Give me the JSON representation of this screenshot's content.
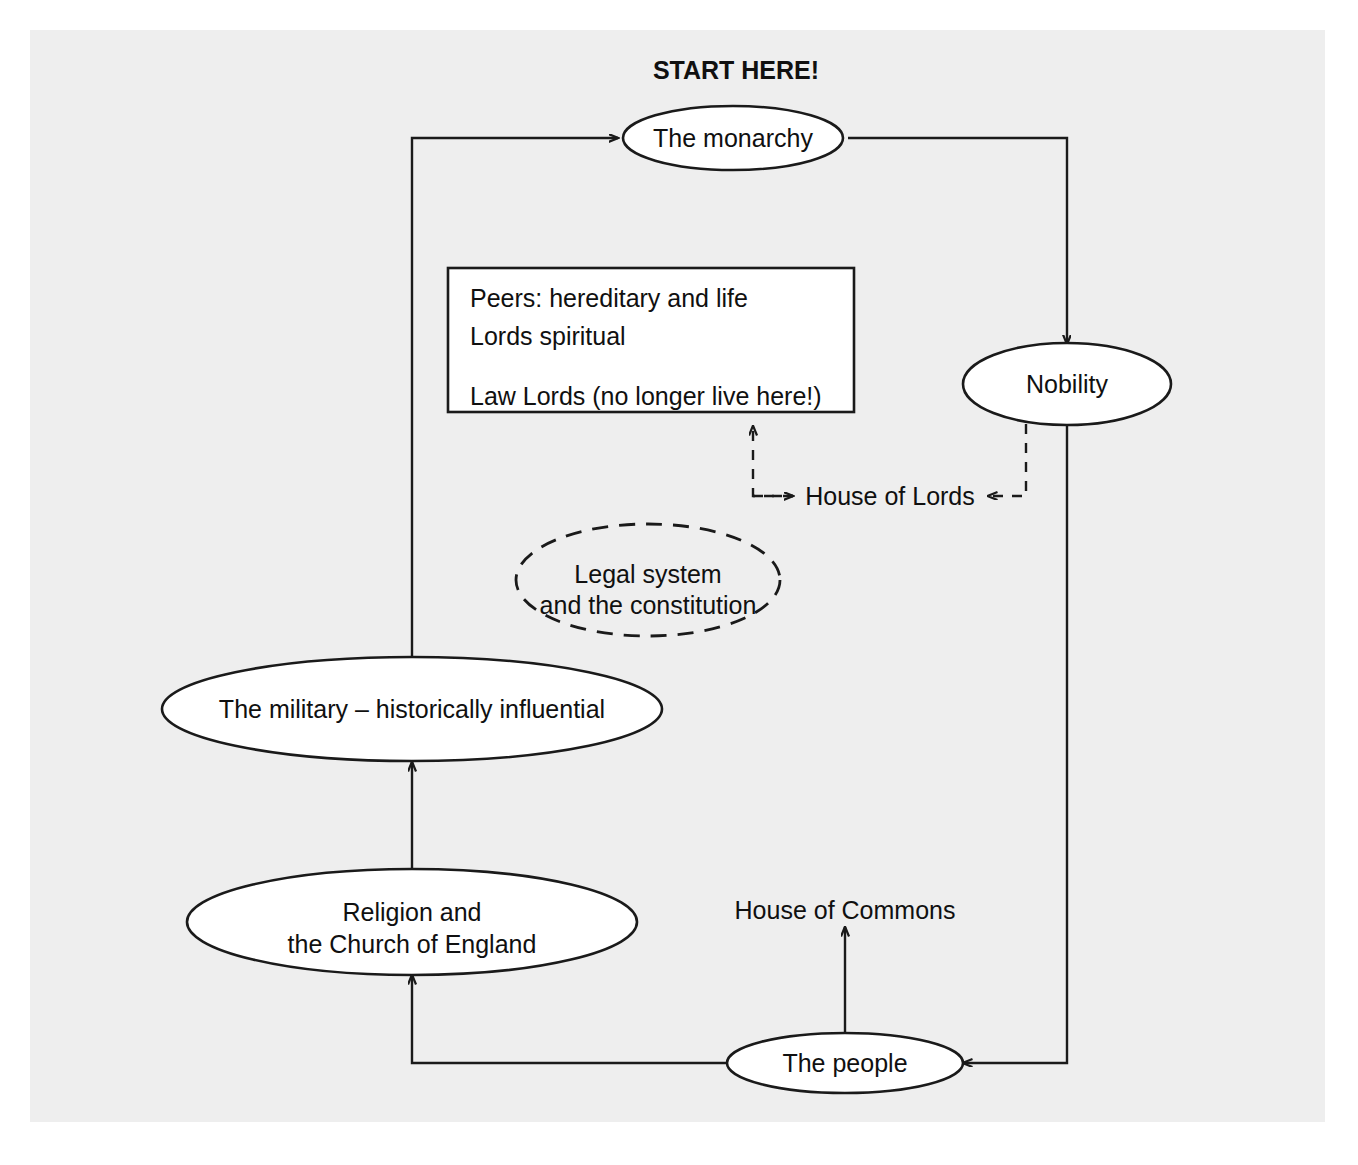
{
  "diagram": {
    "title": "START HERE!",
    "nodes": {
      "monarchy": {
        "label": "The monarchy"
      },
      "nobility": {
        "label": "Nobility"
      },
      "military": {
        "label": "The military – historically influential"
      },
      "religion": {
        "line1": "Religion and",
        "line2": "the Church of England"
      },
      "people": {
        "label": "The people"
      },
      "legal": {
        "line1": "Legal system",
        "line2": "and the constitution"
      }
    },
    "lords_box": {
      "line1": "Peers: hereditary and life",
      "line2": "Lords spiritual",
      "line3": "Law Lords (no longer live here!)"
    },
    "labels": {
      "house_of_lords": "House of Lords",
      "house_of_commons": "House of Commons"
    },
    "colors": {
      "background": "#eeeeee",
      "page": "#ffffff",
      "stroke": "#1a1a1a",
      "shape_fill": "#ffffff",
      "text": "#101010"
    }
  }
}
